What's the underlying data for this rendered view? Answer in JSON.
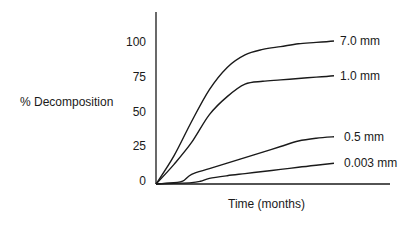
{
  "chart_data": {
    "type": "line",
    "title": "",
    "xlabel": "Time (months)",
    "ylabel": "% Decomposition",
    "ylim": [
      0,
      120
    ],
    "xlim": [
      0,
      12
    ],
    "yticks": [
      "0",
      "25",
      "50",
      "75",
      "100"
    ],
    "ytick_values": [
      0,
      25,
      50,
      75,
      100
    ],
    "xticks": [],
    "grid": false,
    "legend": "inline-right",
    "series": [
      {
        "name": "7.0 mm",
        "x": [
          0,
          1,
          2,
          3,
          4,
          5,
          6,
          7,
          8,
          9,
          10
        ],
        "y": [
          0,
          20,
          45,
          68,
          84,
          93,
          97,
          99,
          101,
          102,
          103
        ]
      },
      {
        "name": "1.0 mm",
        "x": [
          0,
          1,
          2,
          3,
          4,
          5,
          6,
          7,
          8,
          9,
          10
        ],
        "y": [
          0,
          14,
          30,
          50,
          63,
          72,
          74,
          75,
          76,
          77,
          78
        ]
      },
      {
        "name": "0.5 mm",
        "x": [
          0,
          1,
          1.5,
          2,
          3,
          4,
          5,
          6,
          7,
          8,
          9,
          10
        ],
        "y": [
          0,
          1,
          2,
          7,
          11,
          15,
          19,
          23,
          27,
          31,
          33,
          34
        ]
      },
      {
        "name": "0.003 mm",
        "x": [
          0,
          1,
          2,
          2.5,
          3,
          4,
          5,
          6,
          7,
          8,
          9,
          10
        ],
        "y": [
          0,
          0.5,
          1,
          2,
          4,
          6,
          7.5,
          9,
          10.5,
          12,
          13.5,
          15
        ]
      }
    ]
  }
}
